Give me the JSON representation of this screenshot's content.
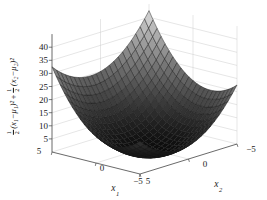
{
  "chart_data": {
    "type": "surface",
    "title": "",
    "formula": "f(x1,x2) = 1/2*(x1-mu1)^2 + 1/2*(x2-mu2)^2",
    "mu": [
      -2,
      1
    ],
    "x1_range": [
      5,
      -5
    ],
    "x2_range": [
      5,
      -5
    ],
    "grid_divisions": 22,
    "colormap": "gray",
    "grid": "on",
    "z_axis": {
      "limit": [
        0,
        45
      ],
      "ticks": [
        {
          "v": 5,
          "t": "5"
        },
        {
          "v": 10,
          "t": "10"
        },
        {
          "v": 15,
          "t": "15"
        },
        {
          "v": 20,
          "t": "20"
        },
        {
          "v": 25,
          "t": "25"
        },
        {
          "v": 30,
          "t": "30"
        },
        {
          "v": 35,
          "t": "35"
        },
        {
          "v": 40,
          "t": "40"
        }
      ]
    },
    "x1_axis": {
      "label_base": "x",
      "label_sub": "1",
      "ticks": [
        {
          "v": 5,
          "t": "5"
        },
        {
          "v": 0,
          "t": "0"
        },
        {
          "v": -5,
          "t": "−5"
        }
      ]
    },
    "x2_axis": {
      "label_base": "x",
      "label_sub": "2",
      "ticks": [
        {
          "v": 5,
          "t": "5"
        },
        {
          "v": 0,
          "t": "0"
        },
        {
          "v": -5,
          "t": "−5"
        }
      ]
    },
    "zlabel": {
      "f1n": "1",
      "f1d": "2",
      "t1": "(x₁−μ₁)²",
      "plus": "+",
      "f2n": "1",
      "f2d": "2",
      "t2": "(x₂−μ₂)²"
    },
    "colors": {
      "background": "#ffffff",
      "mesh_edge": "#1a1a1a",
      "grid_line": "#cccccc",
      "axis_line": "#444444",
      "text": "#1a1a1a",
      "surface_low": "#0a0a0a",
      "surface_high": "#f5f5f5"
    }
  }
}
